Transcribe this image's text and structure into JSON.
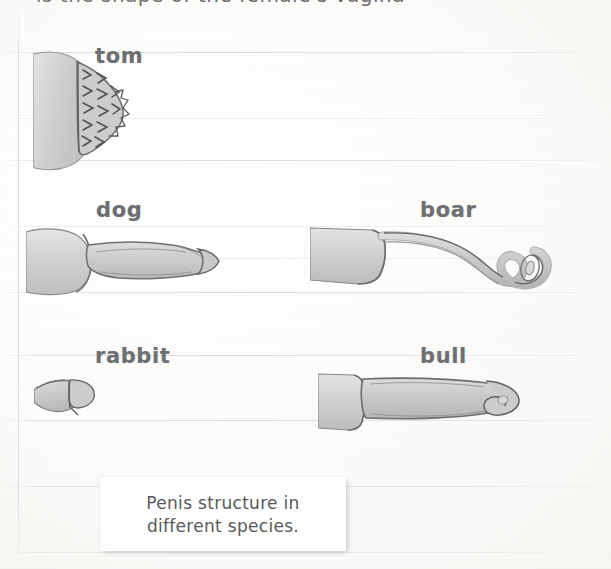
{
  "page": {
    "width": 611,
    "height": 569,
    "background_color": "#fdfdfc",
    "rule_line_color": "#c4c6c8",
    "ink_color": "#6d6f70",
    "drawing_fill": "#cfd0cf",
    "drawing_outline": "#6b6c6b"
  },
  "top_cutoff_text": "is the shape of the female's vagina",
  "figure": {
    "specimens": [
      {
        "id": "tom",
        "label": "tom",
        "icon": "spined-cone-drawing",
        "label_x": 95,
        "label_y": 44,
        "draw_x": 33,
        "draw_y": 48,
        "draw_w": 120,
        "draw_h": 125
      },
      {
        "id": "dog",
        "label": "dog",
        "icon": "bulbous-shaft-drawing",
        "label_x": 96,
        "label_y": 198,
        "draw_x": 26,
        "draw_y": 228,
        "draw_w": 210,
        "draw_h": 68
      },
      {
        "id": "boar",
        "label": "boar",
        "icon": "corkscrew-spiral-drawing",
        "label_x": 420,
        "label_y": 198,
        "draw_x": 310,
        "draw_y": 226,
        "draw_w": 250,
        "draw_h": 80
      },
      {
        "id": "rabbit",
        "label": "rabbit",
        "icon": "small-rounded-tip-drawing",
        "label_x": 95,
        "label_y": 344,
        "draw_x": 34,
        "draw_y": 374,
        "draw_w": 80,
        "draw_h": 42
      },
      {
        "id": "bull",
        "label": "bull",
        "icon": "thick-cylinder-twisted-tip-drawing",
        "label_x": 420,
        "label_y": 344,
        "draw_x": 318,
        "draw_y": 368,
        "draw_w": 220,
        "draw_h": 72
      }
    ]
  },
  "caption": {
    "line1": "Penis structure in",
    "line2": "different species."
  },
  "rules": {
    "horizontal_y": [
      52,
      118,
      160,
      226,
      258,
      292,
      355,
      420,
      486,
      552
    ],
    "vertical_x": [
      18
    ]
  }
}
